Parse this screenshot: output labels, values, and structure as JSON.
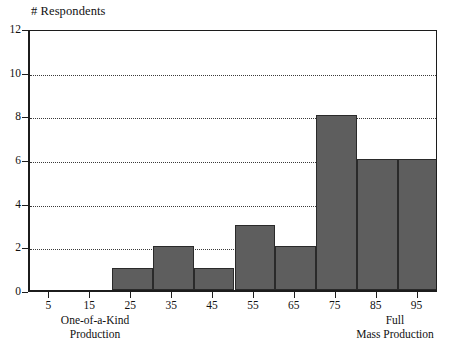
{
  "chart_data": {
    "type": "bar",
    "title": "",
    "xlabel": "",
    "ylabel": "# Respondents",
    "categories": [
      "5",
      "15",
      "25",
      "35",
      "45",
      "55",
      "65",
      "75",
      "85",
      "95"
    ],
    "values": [
      0,
      0,
      1,
      2,
      1,
      3,
      2,
      8,
      6,
      6
    ],
    "ylim": [
      0,
      12
    ],
    "ytick_values": [
      0,
      2,
      4,
      6,
      8,
      10,
      12
    ],
    "gridline_values": [
      2,
      4,
      6,
      8,
      10
    ],
    "grid": "horizontal-dotted",
    "legend": "none",
    "bar_color": "#5e5e5e",
    "bar_edge_color": "#2a2a2a",
    "axis_color": "#1c1c1c",
    "annotations": {
      "left_end": {
        "line1": "One-of-a-Kind",
        "line2": "Production"
      },
      "right_end": {
        "line1": "Full",
        "line2": "Mass Production"
      }
    }
  },
  "axes": {
    "y_title": "# Respondents",
    "y_ticks": [
      {
        "label": "12",
        "value": 12
      },
      {
        "label": "10",
        "value": 10
      },
      {
        "label": "8",
        "value": 8
      },
      {
        "label": "6",
        "value": 6
      },
      {
        "label": "4",
        "value": 4
      },
      {
        "label": "2",
        "value": 2
      },
      {
        "label": "0",
        "value": 0
      }
    ],
    "x_ticks": [
      {
        "label": "5"
      },
      {
        "label": "15"
      },
      {
        "label": "25"
      },
      {
        "label": "35"
      },
      {
        "label": "45"
      },
      {
        "label": "55"
      },
      {
        "label": "65"
      },
      {
        "label": "75"
      },
      {
        "label": "85"
      },
      {
        "label": "95"
      }
    ]
  },
  "captions": {
    "left_line1": "One-of-a-Kind",
    "left_line2": "Production",
    "right_line1": "Full",
    "right_line2": "Mass Production"
  }
}
